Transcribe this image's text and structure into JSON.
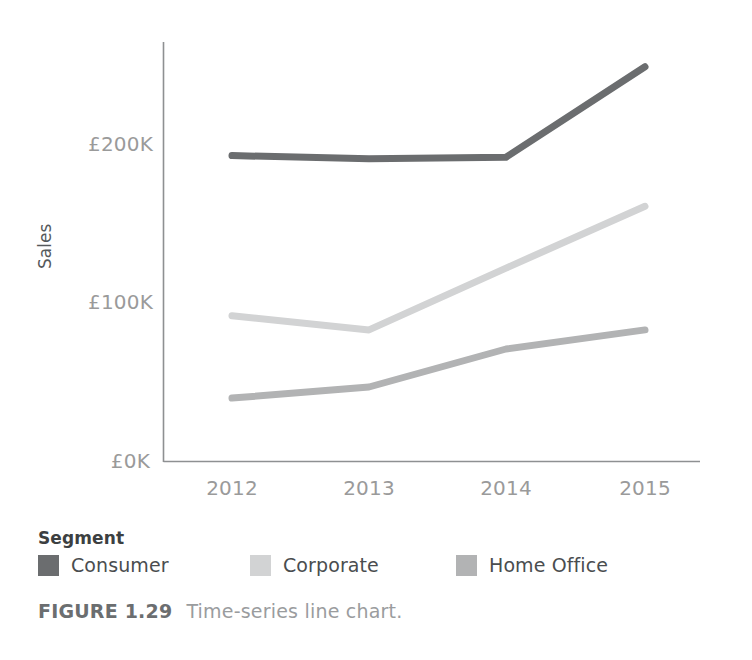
{
  "chart_data": {
    "type": "line",
    "title": "",
    "xlabel": "",
    "ylabel": "Sales",
    "categories": [
      "2012",
      "2013",
      "2014",
      "2015"
    ],
    "x_tick_labels": [
      "2012",
      "2013",
      "2014",
      "2015"
    ],
    "y_tick_labels": [
      "£0K",
      "£100K",
      "£200K"
    ],
    "y_tick_values": [
      0,
      100000,
      200000
    ],
    "ylim": [
      0,
      250000
    ],
    "y_unit": "£",
    "grid": false,
    "legend_position": "bottom-left",
    "legend_title": "Segment",
    "series": [
      {
        "name": "Consumer",
        "color": "#6b6d6f",
        "values": [
          193000,
          191000,
          192000,
          249000
        ]
      },
      {
        "name": "Corporate",
        "color": "#d2d3d4",
        "values": [
          92000,
          83000,
          122000,
          161000
        ]
      },
      {
        "name": "Home Office",
        "color": "#b2b3b4",
        "values": [
          40000,
          47000,
          71000,
          83000
        ]
      }
    ]
  },
  "axes": {
    "y_title": "Sales",
    "axis_line_color": "#8e9092"
  },
  "legend": {
    "title": "Segment",
    "items": [
      {
        "label": "Consumer",
        "color": "#6b6d6f"
      },
      {
        "label": "Corporate",
        "color": "#d2d3d4"
      },
      {
        "label": "Home Office",
        "color": "#b2b3b4"
      }
    ]
  },
  "caption": {
    "figure_number": "FIGURE 1.29",
    "text": "Time-series line chart."
  }
}
